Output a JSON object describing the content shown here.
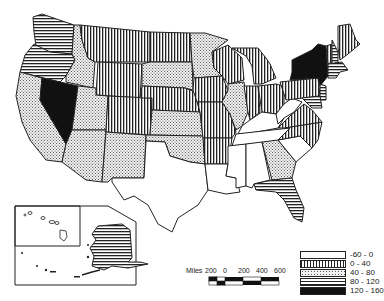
{
  "map": {
    "type": "choropleth",
    "region": "United States",
    "legend": {
      "items": [
        {
          "label": "-60 - 0",
          "pattern": "blank"
        },
        {
          "label": "0 - 40",
          "pattern": "vertical"
        },
        {
          "label": "40 - 80",
          "pattern": "dots"
        },
        {
          "label": "80 - 120",
          "pattern": "horizontal"
        },
        {
          "label": "120 - 160",
          "pattern": "solid"
        }
      ]
    },
    "scale_bar": {
      "unit_label": "Miles",
      "ticks": [
        "200",
        "0",
        "200",
        "400",
        "600"
      ]
    },
    "states": {
      "WA": "horizontal",
      "OR": "horizontal",
      "CA": "dots",
      "NV": "solid",
      "ID": "dots",
      "MT": "vertical",
      "WY": "vertical",
      "UT": "dots",
      "AZ": "dots",
      "CO": "vertical",
      "NM": "dots",
      "ND": "vertical",
      "SD": "dots",
      "NE": "vertical",
      "KS": "dots",
      "OK": "dots",
      "TX": "blank",
      "MN": "dots",
      "IA": "vertical",
      "MO": "vertical",
      "AR": "vertical",
      "LA": "blank",
      "WI": "vertical",
      "IL": "dots",
      "MI": "vertical",
      "IN": "vertical",
      "OH": "vertical",
      "KY": "blank",
      "TN": "blank",
      "MS": "blank",
      "AL": "blank",
      "GA": "dots",
      "FL": "horizontal",
      "SC": "blank",
      "NC": "vertical",
      "VA": "vertical",
      "WV": "blank",
      "PA": "vertical",
      "NY": "solid",
      "NJ": "horizontal",
      "MD": "horizontal",
      "DE": "horizontal",
      "CT": "horizontal",
      "RI": "horizontal",
      "MA": "horizontal",
      "VT": "vertical",
      "NH": "horizontal",
      "ME": "vertical",
      "AK": "horizontal",
      "HI": "blank"
    }
  }
}
